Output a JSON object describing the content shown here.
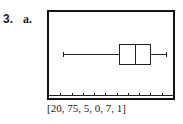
{
  "problem": {
    "number": "3.",
    "part": "a."
  },
  "window_label": "[20, 75, 5, 0, 7, 1]",
  "chart_data": {
    "type": "boxplot",
    "title": "",
    "window": {
      "xmin": 20,
      "xmax": 75,
      "xscl": 5,
      "ymin": 0,
      "ymax": 7,
      "yscl": 1
    },
    "x_ticks": [
      25,
      30,
      35,
      40,
      45,
      50,
      55,
      60,
      65,
      70
    ],
    "series": [
      {
        "name": "data",
        "min": 26,
        "q1": 51,
        "median": 58,
        "q3": 65,
        "max": 72
      }
    ],
    "grid": false,
    "legend": false
  }
}
